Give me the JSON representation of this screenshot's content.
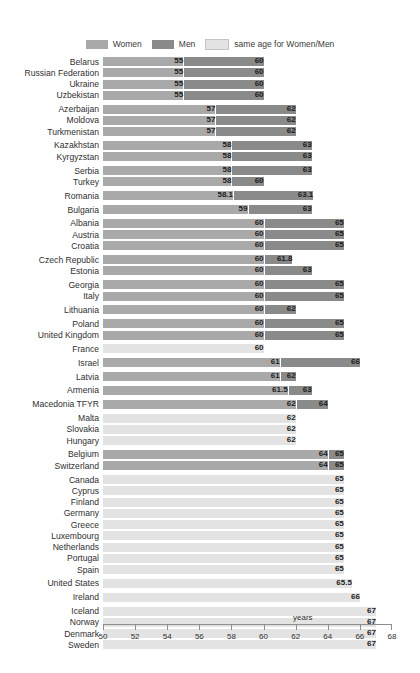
{
  "legend": {
    "items": [
      {
        "label": "Women",
        "color": "#a9a9a9",
        "key": "women"
      },
      {
        "label": "Men",
        "color": "#8a8a8a",
        "key": "men"
      },
      {
        "label": "same age for Women/Men",
        "color": "#e3e3e3",
        "key": "same"
      }
    ]
  },
  "axis": {
    "unit_label": "years",
    "ticks": [
      50,
      52,
      54,
      56,
      58,
      60,
      62,
      64,
      66,
      68
    ],
    "min": 50,
    "max": 68
  },
  "chart_data": {
    "type": "bar",
    "orientation": "horizontal",
    "title": "",
    "subtitle": "",
    "xlabel": "years",
    "ylabel": "",
    "xlim": [
      50,
      68
    ],
    "grid": false,
    "legend_position": "top-center",
    "series": [
      {
        "name": "Women",
        "color": "#a9a9a9"
      },
      {
        "name": "Men",
        "color": "#8a8a8a"
      },
      {
        "name": "same age for Women/Men",
        "color": "#e3e3e3"
      }
    ],
    "categories": [
      "Belarus",
      "Russian Federation",
      "Ukraine",
      "Uzbekistan",
      "Azerbaijan",
      "Moldova",
      "Turkmenistan",
      "Kazakhstan",
      "Kyrgyzstan",
      "Serbia",
      "Turkey",
      "Romania",
      "Bulgaria",
      "Albania",
      "Austria",
      "Croatia",
      "Czech Republic",
      "Estonia",
      "Georgia",
      "Italy",
      "Lithuania",
      "Poland",
      "United Kingdom",
      "France",
      "Israel",
      "Latvia",
      "Armenia",
      "Macedonia TFYR",
      "Malta",
      "Slovakia",
      "Hungary",
      "Belgium",
      "Switzerland",
      "Canada",
      "Cyprus",
      "Finland",
      "Germany",
      "Greece",
      "Luxembourg",
      "Netherlands",
      "Portugal",
      "Spain",
      "United States",
      "Ireland",
      "Iceland",
      "Norway",
      "Denmark",
      "Sweden"
    ],
    "rows": [
      {
        "country": "Belarus",
        "women": 55,
        "men": 60,
        "same": null,
        "women_label": "55",
        "men_label": "60",
        "same_label": null,
        "group": 0
      },
      {
        "country": "Russian Federation",
        "women": 55,
        "men": 60,
        "same": null,
        "women_label": "55",
        "men_label": "60",
        "same_label": null,
        "group": 0
      },
      {
        "country": "Ukraine",
        "women": 55,
        "men": 60,
        "same": null,
        "women_label": "55",
        "men_label": "60",
        "same_label": null,
        "group": 0
      },
      {
        "country": "Uzbekistan",
        "women": 55,
        "men": 60,
        "same": null,
        "women_label": "55",
        "men_label": "60",
        "same_label": null,
        "group": 0
      },
      {
        "country": "Azerbaijan",
        "women": 57,
        "men": 62,
        "same": null,
        "women_label": "57",
        "men_label": "62",
        "same_label": null,
        "group": 1
      },
      {
        "country": "Moldova",
        "women": 57,
        "men": 62,
        "same": null,
        "women_label": "57",
        "men_label": "62",
        "same_label": null,
        "group": 1
      },
      {
        "country": "Turkmenistan",
        "women": 57,
        "men": 62,
        "same": null,
        "women_label": "57",
        "men_label": "62",
        "same_label": null,
        "group": 1
      },
      {
        "country": "Kazakhstan",
        "women": 58,
        "men": 63,
        "same": null,
        "women_label": "58",
        "men_label": "63",
        "same_label": null,
        "group": 2
      },
      {
        "country": "Kyrgyzstan",
        "women": 58,
        "men": 63,
        "same": null,
        "women_label": "58",
        "men_label": "63",
        "same_label": null,
        "group": 2
      },
      {
        "country": "Serbia",
        "women": 58,
        "men": 63,
        "same": null,
        "women_label": "58",
        "men_label": "63",
        "same_label": null,
        "group": 3
      },
      {
        "country": "Turkey",
        "women": 58,
        "men": 60,
        "same": null,
        "women_label": "58",
        "men_label": "60",
        "same_label": null,
        "group": 3
      },
      {
        "country": "Romania",
        "women": 58.1,
        "men": 63.1,
        "same": null,
        "women_label": "58.1",
        "men_label": "63.1",
        "same_label": null,
        "group": 4
      },
      {
        "country": "Bulgaria",
        "women": 59,
        "men": 63,
        "same": null,
        "women_label": "59",
        "men_label": "63",
        "same_label": null,
        "group": 5
      },
      {
        "country": "Albania",
        "women": 60,
        "men": 65,
        "same": null,
        "women_label": "60",
        "men_label": "65",
        "same_label": null,
        "group": 6
      },
      {
        "country": "Austria",
        "women": 60,
        "men": 65,
        "same": null,
        "women_label": "60",
        "men_label": "65",
        "same_label": null,
        "group": 6
      },
      {
        "country": "Croatia",
        "women": 60,
        "men": 65,
        "same": null,
        "women_label": "60",
        "men_label": "65",
        "same_label": null,
        "group": 6
      },
      {
        "country": "Czech Republic",
        "women": 60,
        "men": 61.8,
        "same": null,
        "women_label": "60",
        "men_label": "61.8",
        "same_label": null,
        "group": 7
      },
      {
        "country": "Estonia",
        "women": 60,
        "men": 63,
        "same": null,
        "women_label": "60",
        "men_label": "63",
        "same_label": null,
        "group": 7
      },
      {
        "country": "Georgia",
        "women": 60,
        "men": 65,
        "same": null,
        "women_label": "60",
        "men_label": "65",
        "same_label": null,
        "group": 8
      },
      {
        "country": "Italy",
        "women": 60,
        "men": 65,
        "same": null,
        "women_label": "60",
        "men_label": "65",
        "same_label": null,
        "group": 8
      },
      {
        "country": "Lithuania",
        "women": 60,
        "men": 62,
        "same": null,
        "women_label": "60",
        "men_label": "62",
        "same_label": null,
        "group": 9
      },
      {
        "country": "Poland",
        "women": 60,
        "men": 65,
        "same": null,
        "women_label": "60",
        "men_label": "65",
        "same_label": null,
        "group": 10
      },
      {
        "country": "United Kingdom",
        "women": 60,
        "men": 65,
        "same": null,
        "women_label": "60",
        "men_label": "65",
        "same_label": null,
        "group": 10
      },
      {
        "country": "France",
        "women": null,
        "men": null,
        "same": 60,
        "women_label": null,
        "men_label": null,
        "same_label": "60",
        "group": 11
      },
      {
        "country": "Israel",
        "women": 61,
        "men": 66,
        "same": null,
        "women_label": "61",
        "men_label": "66",
        "same_label": null,
        "group": 12
      },
      {
        "country": "Latvia",
        "women": 61,
        "men": 62,
        "same": null,
        "women_label": "61",
        "men_label": "62",
        "same_label": null,
        "group": 13
      },
      {
        "country": "Armenia",
        "women": 61.5,
        "men": 63,
        "same": null,
        "women_label": "61.5",
        "men_label": "63",
        "same_label": null,
        "group": 14
      },
      {
        "country": "Macedonia TFYR",
        "women": 62,
        "men": 64,
        "same": null,
        "women_label": "62",
        "men_label": "64",
        "same_label": null,
        "group": 15
      },
      {
        "country": "Malta",
        "women": null,
        "men": null,
        "same": 62,
        "women_label": null,
        "men_label": null,
        "same_label": "62",
        "group": 16
      },
      {
        "country": "Slovakia",
        "women": null,
        "men": null,
        "same": 62,
        "women_label": null,
        "men_label": null,
        "same_label": "62",
        "group": 16
      },
      {
        "country": "Hungary",
        "women": null,
        "men": null,
        "same": 62,
        "women_label": null,
        "men_label": null,
        "same_label": "62",
        "group": 16
      },
      {
        "country": "Belgium",
        "women": 64,
        "men": 65,
        "same": null,
        "women_label": "64",
        "men_label": "65",
        "same_label": null,
        "group": 17
      },
      {
        "country": "Switzerland",
        "women": 64,
        "men": 65,
        "same": null,
        "women_label": "64",
        "men_label": "65",
        "same_label": null,
        "group": 17
      },
      {
        "country": "Canada",
        "women": null,
        "men": null,
        "same": 65,
        "women_label": null,
        "men_label": null,
        "same_label": "65",
        "group": 18
      },
      {
        "country": "Cyprus",
        "women": null,
        "men": null,
        "same": 65,
        "women_label": null,
        "men_label": null,
        "same_label": "65",
        "group": 18
      },
      {
        "country": "Finland",
        "women": null,
        "men": null,
        "same": 65,
        "women_label": null,
        "men_label": null,
        "same_label": "65",
        "group": 18
      },
      {
        "country": "Germany",
        "women": null,
        "men": null,
        "same": 65,
        "women_label": null,
        "men_label": null,
        "same_label": "65",
        "group": 18
      },
      {
        "country": "Greece",
        "women": null,
        "men": null,
        "same": 65,
        "women_label": null,
        "men_label": null,
        "same_label": "65",
        "group": 18
      },
      {
        "country": "Luxembourg",
        "women": null,
        "men": null,
        "same": 65,
        "women_label": null,
        "men_label": null,
        "same_label": "65",
        "group": 18
      },
      {
        "country": "Netherlands",
        "women": null,
        "men": null,
        "same": 65,
        "women_label": null,
        "men_label": null,
        "same_label": "65",
        "group": 18
      },
      {
        "country": "Portugal",
        "women": null,
        "men": null,
        "same": 65,
        "women_label": null,
        "men_label": null,
        "same_label": "65",
        "group": 18
      },
      {
        "country": "Spain",
        "women": null,
        "men": null,
        "same": 65,
        "women_label": null,
        "men_label": null,
        "same_label": "65",
        "group": 18
      },
      {
        "country": "United States",
        "women": null,
        "men": null,
        "same": 65.5,
        "women_label": null,
        "men_label": null,
        "same_label": "65.5",
        "group": 19
      },
      {
        "country": "Ireland",
        "women": null,
        "men": null,
        "same": 66,
        "women_label": null,
        "men_label": null,
        "same_label": "66",
        "group": 20
      },
      {
        "country": "Iceland",
        "women": null,
        "men": null,
        "same": 67,
        "women_label": null,
        "men_label": null,
        "same_label": "67",
        "group": 21
      },
      {
        "country": "Norway",
        "women": null,
        "men": null,
        "same": 67,
        "women_label": null,
        "men_label": null,
        "same_label": "67",
        "group": 21
      },
      {
        "country": "Denmark",
        "women": null,
        "men": null,
        "same": 67,
        "women_label": null,
        "men_label": null,
        "same_label": "67",
        "group": 21
      },
      {
        "country": "Sweden",
        "women": null,
        "men": null,
        "same": 67,
        "women_label": null,
        "men_label": null,
        "same_label": "67",
        "group": 21
      }
    ]
  }
}
